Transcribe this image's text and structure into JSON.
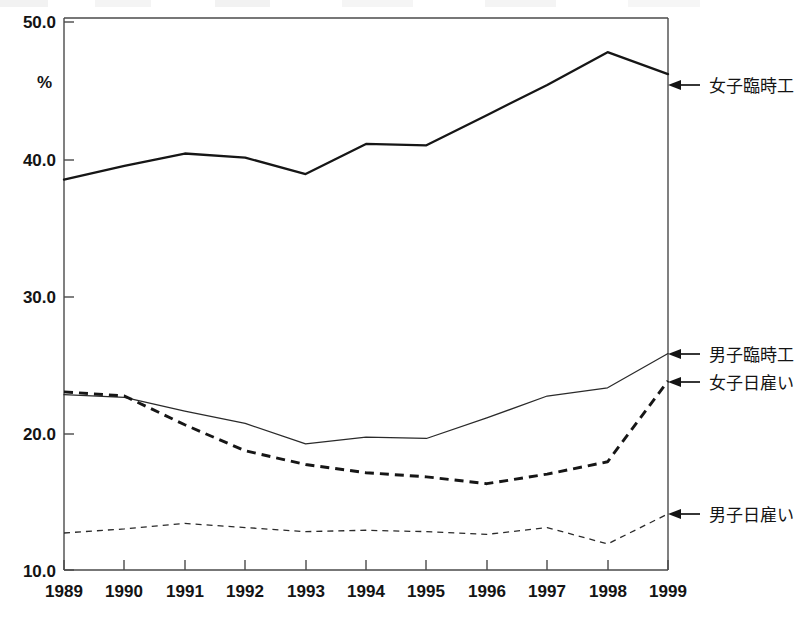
{
  "chart_data": {
    "type": "line",
    "title": "",
    "subtitle": "",
    "xlabel": "",
    "ylabel": "%",
    "categories": [
      "1989",
      "1990",
      "1991",
      "1992",
      "1993",
      "1994",
      "1995",
      "1996",
      "1997",
      "1998",
      "1999"
    ],
    "x": [
      1989,
      1990,
      1991,
      1992,
      1993,
      1994,
      1995,
      1996,
      1997,
      1998,
      1999
    ],
    "ylim": [
      10.0,
      50.0
    ],
    "xlim": [
      1989,
      1999
    ],
    "yticks": [
      "10.0",
      "20.0",
      "30.0",
      "40.0",
      "50.0"
    ],
    "ytick_values": [
      10.0,
      20.0,
      30.0,
      40.0,
      50.0
    ],
    "grid": false,
    "legend_position": "right-inline-arrows",
    "series": [
      {
        "name": "女子臨時工",
        "style": "solid-thick",
        "values": [
          38.5,
          39.5,
          40.4,
          40.1,
          38.9,
          41.1,
          41.0,
          43.2,
          45.4,
          47.8,
          46.2
        ]
      },
      {
        "name": "男子臨時工",
        "style": "solid-thin",
        "values": [
          22.8,
          22.6,
          21.6,
          20.7,
          19.2,
          19.7,
          19.6,
          21.1,
          22.7,
          23.3,
          25.8
        ]
      },
      {
        "name": "女子日雇い",
        "style": "dashed-thick",
        "values": [
          23.0,
          22.7,
          20.6,
          18.7,
          17.7,
          17.1,
          16.8,
          16.3,
          17.0,
          17.9,
          23.8
        ]
      },
      {
        "name": "男子日雇い",
        "style": "dashed-thin",
        "values": [
          12.7,
          13.0,
          13.4,
          13.1,
          12.8,
          12.9,
          12.8,
          12.6,
          13.1,
          11.9,
          14.1
        ]
      }
    ],
    "annotations": [
      {
        "label": "女子臨時工",
        "arrow": "left",
        "at_year": 1999,
        "at_value": 46.2
      },
      {
        "label": "男子臨時工",
        "arrow": "left",
        "at_year": 1999,
        "at_value": 25.8
      },
      {
        "label": "女子日雇い",
        "arrow": "left",
        "at_year": 1999,
        "at_value": 23.8
      },
      {
        "label": "男子日雇い",
        "arrow": "left",
        "at_year": 1999,
        "at_value": 14.1
      }
    ]
  },
  "axis": {
    "y_unit": "%",
    "y_tick_0": "10.0",
    "y_tick_1": "20.0",
    "y_tick_2": "30.0",
    "y_tick_3": "40.0",
    "y_tick_4": "50.0"
  },
  "xaxis": {
    "t0": "1989",
    "t1": "1990",
    "t2": "1991",
    "t3": "1992",
    "t4": "1993",
    "t5": "1994",
    "t6": "1995",
    "t7": "1996",
    "t8": "1997",
    "t9": "1998",
    "t10": "1999"
  },
  "labels": {
    "l0": "女子臨時工",
    "l1": "男子臨時工",
    "l2": "女子日雇い",
    "l3": "男子日雇い"
  }
}
